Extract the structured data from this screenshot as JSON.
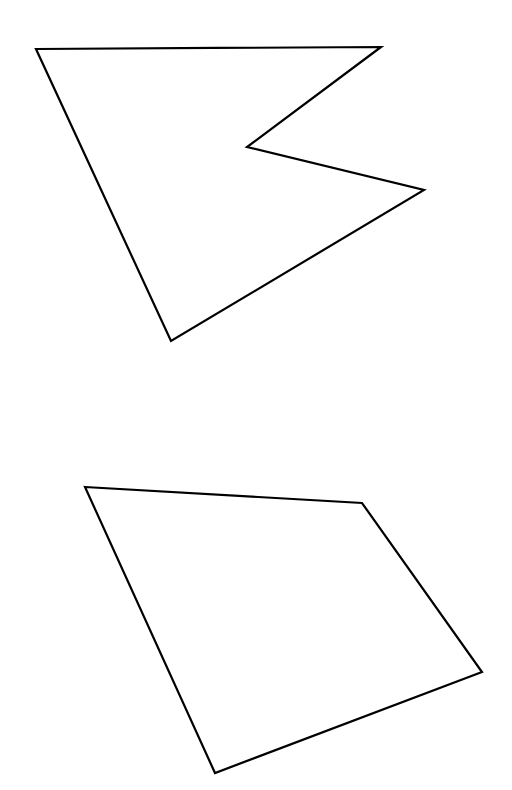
{
  "canvas": {
    "width": 512,
    "height": 790,
    "background_color": "#ffffff"
  },
  "style": {
    "stroke_color": "#000000",
    "stroke_width": 2.2,
    "fill": "none"
  },
  "shapes": [
    {
      "name": "concave-arrow-polygon",
      "label": "Top concave pentagon",
      "vertex_count": 5,
      "closed": true,
      "points": "36,49 381,47 247,147 424,190 171,341",
      "vertices": [
        {
          "x": 36,
          "y": 49,
          "name": "top-left-vertex"
        },
        {
          "x": 381,
          "y": 47,
          "name": "top-right-vertex"
        },
        {
          "x": 247,
          "y": 147,
          "name": "notch-reflex-vertex"
        },
        {
          "x": 424,
          "y": 190,
          "name": "right-spike-vertex"
        },
        {
          "x": 171,
          "y": 341,
          "name": "bottom-vertex"
        }
      ]
    },
    {
      "name": "convex-quadrilateral",
      "label": "Bottom convex quadrilateral",
      "vertex_count": 4,
      "closed": true,
      "points": "85,487 362,503 482,672 215,773",
      "vertices": [
        {
          "x": 85,
          "y": 487,
          "name": "top-left-vertex"
        },
        {
          "x": 362,
          "y": 503,
          "name": "top-right-vertex"
        },
        {
          "x": 482,
          "y": 672,
          "name": "bottom-right-vertex"
        },
        {
          "x": 215,
          "y": 773,
          "name": "bottom-left-vertex"
        }
      ]
    }
  ]
}
